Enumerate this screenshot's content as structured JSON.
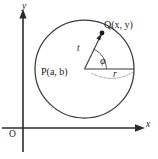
{
  "figure": {
    "type": "geometry-diagram",
    "background_color": "#ffffff",
    "line_color": "#3a3a3a",
    "axis_color": "#2b2b2b"
  },
  "axes": {
    "y_label": "y",
    "x_label": "x",
    "origin_label": "O",
    "x_axis_name": "horizontal-axis",
    "y_axis_name": "vertical-axis"
  },
  "points": {
    "center": {
      "label": "P(a, b)",
      "name": "P",
      "coord_x": "a",
      "coord_y": "b"
    },
    "on_circle": {
      "label": "Q(x, y)",
      "name": "Q",
      "coord_x": "x",
      "coord_y": "y"
    }
  },
  "segments": {
    "radius_label": "r",
    "ray_label": "t"
  },
  "angle": {
    "label": "φ",
    "name": "phi"
  },
  "geometry": {
    "circle_center_x": 84.5,
    "circle_center_y": 69,
    "circle_radius": 49,
    "q_point_x": 102,
    "q_point_y": 33,
    "y_axis_x": 23,
    "x_axis_y": 128
  }
}
